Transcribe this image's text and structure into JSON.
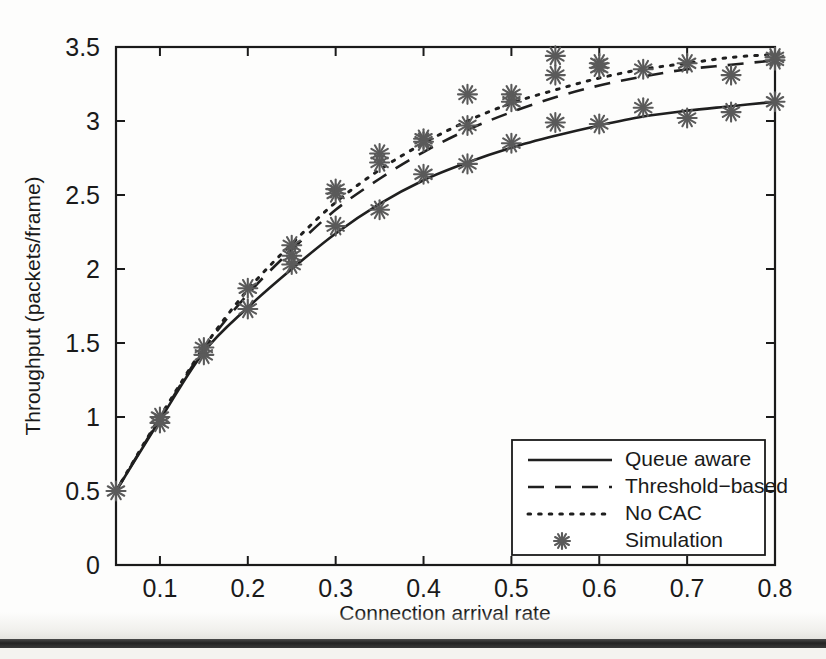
{
  "chart_data": {
    "type": "line",
    "title": "",
    "xlabel": "Connection arrival rate",
    "ylabel": "Throughput (packets/frame)",
    "xlim": [
      0.05,
      0.8
    ],
    "ylim": [
      0,
      3.5
    ],
    "xticks": [
      0.1,
      0.2,
      0.3,
      0.4,
      0.5,
      0.6,
      0.7,
      0.8
    ],
    "xticklabels": [
      "0.1",
      "0.2",
      "0.3",
      "0.4",
      "0.5",
      "0.6",
      "0.7",
      "0.8"
    ],
    "yticks": [
      0,
      0.5,
      1,
      1.5,
      2,
      2.5,
      3,
      3.5
    ],
    "yticklabels": [
      "0",
      "0.5",
      "1",
      "1.5",
      "2",
      "2.5",
      "3",
      "3.5"
    ],
    "grid": false,
    "legend_position": "lower right",
    "x": [
      0.05,
      0.1,
      0.15,
      0.2,
      0.25,
      0.3,
      0.35,
      0.4,
      0.45,
      0.5,
      0.55,
      0.6,
      0.65,
      0.7,
      0.75,
      0.8
    ],
    "series": [
      {
        "name": "Queue aware",
        "style": "solid",
        "values": [
          0.5,
          0.98,
          1.44,
          1.74,
          2.0,
          2.24,
          2.44,
          2.6,
          2.72,
          2.82,
          2.9,
          2.97,
          3.03,
          3.07,
          3.1,
          3.13
        ]
      },
      {
        "name": "Threshold-based",
        "style": "dashed",
        "values": [
          0.5,
          0.99,
          1.46,
          1.83,
          2.13,
          2.4,
          2.61,
          2.79,
          2.94,
          3.06,
          3.16,
          3.24,
          3.3,
          3.35,
          3.38,
          3.41
        ]
      },
      {
        "name": "No CAC",
        "style": "dotted",
        "values": [
          0.5,
          1.0,
          1.47,
          1.86,
          2.17,
          2.45,
          2.67,
          2.85,
          3.0,
          3.12,
          3.21,
          3.29,
          3.35,
          3.39,
          3.43,
          3.45
        ]
      },
      {
        "name": "Simulation",
        "style": "marker",
        "marker": "asterisk",
        "points": [
          {
            "x": 0.05,
            "y": 0.5
          },
          {
            "x": 0.1,
            "y": 1.0
          },
          {
            "x": 0.1,
            "y": 0.96
          },
          {
            "x": 0.15,
            "y": 1.47
          },
          {
            "x": 0.15,
            "y": 1.42
          },
          {
            "x": 0.2,
            "y": 1.87
          },
          {
            "x": 0.2,
            "y": 1.73
          },
          {
            "x": 0.25,
            "y": 2.16
          },
          {
            "x": 0.25,
            "y": 2.09
          },
          {
            "x": 0.25,
            "y": 2.03
          },
          {
            "x": 0.3,
            "y": 2.54
          },
          {
            "x": 0.3,
            "y": 2.51
          },
          {
            "x": 0.3,
            "y": 2.29
          },
          {
            "x": 0.35,
            "y": 2.78
          },
          {
            "x": 0.35,
            "y": 2.72
          },
          {
            "x": 0.35,
            "y": 2.4
          },
          {
            "x": 0.4,
            "y": 2.88
          },
          {
            "x": 0.4,
            "y": 2.86
          },
          {
            "x": 0.4,
            "y": 2.64
          },
          {
            "x": 0.45,
            "y": 3.18
          },
          {
            "x": 0.45,
            "y": 2.97
          },
          {
            "x": 0.45,
            "y": 2.71
          },
          {
            "x": 0.5,
            "y": 3.18
          },
          {
            "x": 0.5,
            "y": 3.13
          },
          {
            "x": 0.5,
            "y": 2.85
          },
          {
            "x": 0.55,
            "y": 3.44
          },
          {
            "x": 0.55,
            "y": 3.31
          },
          {
            "x": 0.55,
            "y": 2.99
          },
          {
            "x": 0.6,
            "y": 3.39
          },
          {
            "x": 0.6,
            "y": 3.36
          },
          {
            "x": 0.6,
            "y": 2.98
          },
          {
            "x": 0.65,
            "y": 3.35
          },
          {
            "x": 0.65,
            "y": 3.09
          },
          {
            "x": 0.7,
            "y": 3.39
          },
          {
            "x": 0.7,
            "y": 3.02
          },
          {
            "x": 0.75,
            "y": 3.31
          },
          {
            "x": 0.75,
            "y": 3.06
          },
          {
            "x": 0.8,
            "y": 3.43
          },
          {
            "x": 0.8,
            "y": 3.41
          },
          {
            "x": 0.8,
            "y": 3.13
          }
        ]
      }
    ],
    "legend": [
      {
        "label": "Queue aware",
        "style": "solid"
      },
      {
        "label": "Threshold−based",
        "style": "dashed"
      },
      {
        "label": "No CAC",
        "style": "dotted"
      },
      {
        "label": "Simulation",
        "style": "marker"
      }
    ]
  },
  "colors": {
    "axis": "#1a1a1a",
    "curve": "#1f1f1f",
    "marker": "#5a5a5a",
    "background": "#fdfdfc"
  }
}
